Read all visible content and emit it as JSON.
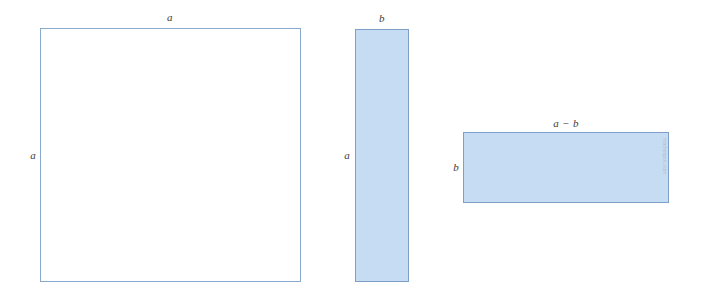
{
  "figure": {
    "background_color": "#ffffff",
    "fill_color": "#c6dcf3",
    "stroke_color": "#7d9fc8",
    "label_color": "#3c3c3c"
  },
  "shapes": [
    {
      "id": "square-a",
      "kind": "square",
      "fill": "none",
      "top_label": "a",
      "left_label": "a"
    },
    {
      "id": "rect-a-b",
      "kind": "rectangle",
      "fill": "#c6dcf3",
      "top_label": "b",
      "left_label": "a"
    },
    {
      "id": "rect-a-minus-b",
      "kind": "rectangle",
      "fill": "#c6dcf3",
      "top_label": "a − b",
      "left_label": "b"
    }
  ],
  "watermark": {
    "text": "mathsspot.com"
  }
}
